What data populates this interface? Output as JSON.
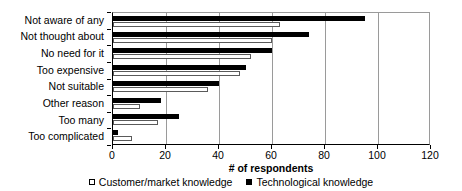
{
  "chart_data": {
    "type": "bar",
    "orientation": "horizontal",
    "title": "",
    "xlabel": "# of respondents",
    "ylabel": "",
    "xlim": [
      0,
      120
    ],
    "xticks": [
      0,
      20,
      40,
      60,
      80,
      100,
      120
    ],
    "grid": true,
    "legend_position": "bottom",
    "categories": [
      "Not aware of any",
      "Not thought about",
      "No need for it",
      "Too expensive",
      "Not suitable",
      "Other reason",
      "Too many",
      "Too complicated"
    ],
    "series": [
      {
        "name": "Customer/market knowledge",
        "marker": "open-square",
        "color": "#ffffff",
        "edge_color": "#000000",
        "values": [
          63,
          60,
          52,
          48,
          36,
          10,
          17,
          7
        ]
      },
      {
        "name": "Technological knowledge",
        "marker": "filled-square",
        "color": "#000000",
        "edge_color": "#000000",
        "values": [
          95,
          74,
          60,
          50,
          40,
          18,
          25,
          2
        ]
      }
    ]
  },
  "axis": {
    "xlabel": "# of respondents",
    "tick_labels": [
      "0",
      "20",
      "40",
      "60",
      "80",
      "100",
      "120"
    ]
  },
  "legend": {
    "entries": [
      {
        "label": "Customer/market knowledge",
        "swatch": "open-square"
      },
      {
        "label": "Technological knowledge",
        "swatch": "filled-square"
      }
    ]
  }
}
